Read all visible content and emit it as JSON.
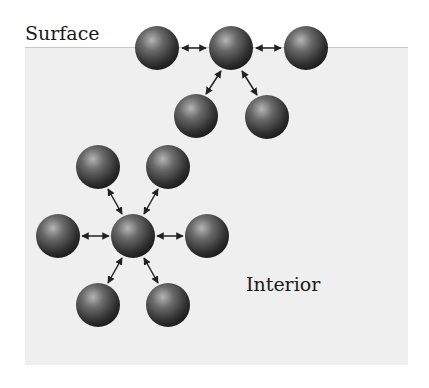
{
  "labels": {
    "surface": "Surface",
    "interior": "Interior"
  },
  "colors": {
    "interior_bg": "#efefef",
    "sphere_dark": "#2a2a2a",
    "sphere_light": "#9a9a9a",
    "arrow": "#222222"
  },
  "spheres": {
    "surface": [
      {
        "x": 157,
        "y": 48
      },
      {
        "x": 231,
        "y": 48
      },
      {
        "x": 306,
        "y": 48
      },
      {
        "x": 196,
        "y": 116
      },
      {
        "x": 267,
        "y": 117
      }
    ],
    "interior": [
      {
        "x": 98,
        "y": 167
      },
      {
        "x": 168,
        "y": 167
      },
      {
        "x": 58,
        "y": 236
      },
      {
        "x": 133,
        "y": 236
      },
      {
        "x": 207,
        "y": 236
      },
      {
        "x": 98,
        "y": 305
      },
      {
        "x": 168,
        "y": 305
      }
    ]
  },
  "bonds": [
    {
      "from": [
        182,
        48
      ],
      "to": [
        206,
        48
      ]
    },
    {
      "from": [
        256,
        48
      ],
      "to": [
        281,
        48
      ]
    },
    {
      "from": [
        221,
        71
      ],
      "to": [
        206,
        94
      ]
    },
    {
      "from": [
        242,
        71
      ],
      "to": [
        257,
        95
      ]
    },
    {
      "from": [
        108,
        189
      ],
      "to": [
        122,
        214
      ]
    },
    {
      "from": [
        158,
        189
      ],
      "to": [
        144,
        214
      ]
    },
    {
      "from": [
        82,
        236
      ],
      "to": [
        109,
        236
      ]
    },
    {
      "from": [
        157,
        236
      ],
      "to": [
        183,
        236
      ]
    },
    {
      "from": [
        122,
        258
      ],
      "to": [
        108,
        283
      ]
    },
    {
      "from": [
        144,
        258
      ],
      "to": [
        158,
        283
      ]
    }
  ]
}
